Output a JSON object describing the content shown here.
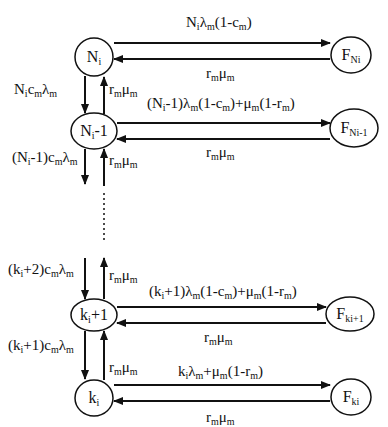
{
  "diagram": {
    "type": "markov-chain-state-transition",
    "colors": {
      "stroke": "#111111",
      "background": "#ffffff",
      "text": "#111111"
    },
    "nodes": [
      {
        "id": "Ni",
        "base": "N",
        "sub": "i",
        "suffix": "",
        "cx": 94,
        "cy": 57,
        "rx": 19,
        "ry": 19
      },
      {
        "id": "Ni-1",
        "base": "N",
        "sub": "i",
        "suffix": "-1",
        "cx": 94,
        "cy": 131,
        "rx": 23,
        "ry": 18
      },
      {
        "id": "ki+1",
        "base": "k",
        "sub": "i",
        "suffix": "+1",
        "cx": 94,
        "cy": 315,
        "rx": 23,
        "ry": 16
      },
      {
        "id": "ki",
        "base": "k",
        "sub": "i",
        "suffix": "",
        "cx": 94,
        "cy": 398,
        "rx": 19,
        "ry": 18
      },
      {
        "id": "FNi",
        "base": "F",
        "sub": "Ni",
        "suffix": "",
        "cx": 351,
        "cy": 55,
        "rx": 20,
        "ry": 18
      },
      {
        "id": "FNi-1",
        "base": "F",
        "sub": "Ni-1",
        "suffix": "",
        "cx": 354,
        "cy": 128,
        "rx": 24,
        "ry": 19
      },
      {
        "id": "Fki+1",
        "base": "F",
        "sub": "ki+1",
        "suffix": "",
        "cx": 350,
        "cy": 314,
        "rx": 24,
        "ry": 17
      },
      {
        "id": "Fki",
        "base": "F",
        "sub": "ki",
        "suffix": "",
        "cx": 351,
        "cy": 397,
        "rx": 20,
        "ry": 18
      }
    ],
    "labels": {
      "Ni_to_FNi": {
        "parts": [
          [
            "N",
            ""
          ],
          [
            "i",
            "sub"
          ],
          [
            "λ",
            ""
          ],
          [
            "m",
            "sub"
          ],
          [
            "(1-c",
            ""
          ],
          [
            "m",
            "sub"
          ],
          [
            ")",
            ""
          ]
        ]
      },
      "FNi_to_Ni": {
        "parts": [
          [
            "r",
            ""
          ],
          [
            "m",
            "sub"
          ],
          [
            "μ",
            ""
          ],
          [
            "m",
            "sub"
          ]
        ]
      },
      "Ni_to_Ni-1": {
        "parts": [
          [
            "N",
            ""
          ],
          [
            "i",
            "sub"
          ],
          [
            "c",
            ""
          ],
          [
            "m",
            "sub"
          ],
          [
            "λ",
            ""
          ],
          [
            "m",
            "sub"
          ]
        ]
      },
      "Ni-1_to_Ni": {
        "parts": [
          [
            "r",
            ""
          ],
          [
            "m",
            "sub"
          ],
          [
            "μ",
            ""
          ],
          [
            "m",
            "sub"
          ]
        ]
      },
      "Ni-1_to_FNi-1": {
        "parts": [
          [
            "(N",
            ""
          ],
          [
            "i",
            "sub"
          ],
          [
            "-1)λ",
            ""
          ],
          [
            "m",
            "sub"
          ],
          [
            "(1-c",
            ""
          ],
          [
            "m",
            "sub"
          ],
          [
            ")+μ",
            ""
          ],
          [
            "m",
            "sub"
          ],
          [
            "(1-r",
            ""
          ],
          [
            "m",
            "sub"
          ],
          [
            ")",
            ""
          ]
        ]
      },
      "FNi-1_to_Ni-1": {
        "parts": [
          [
            "r",
            ""
          ],
          [
            "m",
            "sub"
          ],
          [
            "μ",
            ""
          ],
          [
            "m",
            "sub"
          ]
        ]
      },
      "Ni-1_down": {
        "parts": [
          [
            "(N",
            ""
          ],
          [
            "i",
            "sub"
          ],
          [
            "-1)c",
            ""
          ],
          [
            "m",
            "sub"
          ],
          [
            "λ",
            ""
          ],
          [
            "m",
            "sub"
          ]
        ]
      },
      "Ni-1_up": {
        "parts": [
          [
            "r",
            ""
          ],
          [
            "m",
            "sub"
          ],
          [
            "μ",
            ""
          ],
          [
            "m",
            "sub"
          ]
        ]
      },
      "ki+1_in_down": {
        "parts": [
          [
            "(k",
            ""
          ],
          [
            "i",
            "sub"
          ],
          [
            "+2)c",
            ""
          ],
          [
            "m",
            "sub"
          ],
          [
            "λ",
            ""
          ],
          [
            "m",
            "sub"
          ]
        ]
      },
      "ki+1_out_up": {
        "parts": [
          [
            "r",
            ""
          ],
          [
            "m",
            "sub"
          ],
          [
            "μ",
            ""
          ],
          [
            "m",
            "sub"
          ]
        ]
      },
      "ki+1_to_Fki+1": {
        "parts": [
          [
            "(k",
            ""
          ],
          [
            "i",
            "sub"
          ],
          [
            "+1)λ",
            ""
          ],
          [
            "m",
            "sub"
          ],
          [
            "(1-c",
            ""
          ],
          [
            "m",
            "sub"
          ],
          [
            ")+μ",
            ""
          ],
          [
            "m",
            "sub"
          ],
          [
            "(1-r",
            ""
          ],
          [
            "m",
            "sub"
          ],
          [
            ")",
            ""
          ]
        ]
      },
      "Fki+1_to_ki+1": {
        "parts": [
          [
            "r",
            ""
          ],
          [
            "m",
            "sub"
          ],
          [
            "μ",
            ""
          ],
          [
            "m",
            "sub"
          ]
        ]
      },
      "ki+1_to_ki": {
        "parts": [
          [
            "(k",
            ""
          ],
          [
            "i",
            "sub"
          ],
          [
            "+1)c",
            ""
          ],
          [
            "m",
            "sub"
          ],
          [
            "λ",
            ""
          ],
          [
            "m",
            "sub"
          ]
        ]
      },
      "ki_to_ki+1": {
        "parts": [
          [
            "r",
            ""
          ],
          [
            "m",
            "sub"
          ],
          [
            "μ",
            ""
          ],
          [
            "m",
            "sub"
          ]
        ]
      },
      "ki_to_Fki": {
        "parts": [
          [
            "k",
            ""
          ],
          [
            "i",
            "sub"
          ],
          [
            "λ",
            ""
          ],
          [
            "m",
            "sub"
          ],
          [
            "+μ",
            ""
          ],
          [
            "m",
            "sub"
          ],
          [
            "(1-r",
            ""
          ],
          [
            "m",
            "sub"
          ],
          [
            ")",
            ""
          ]
        ]
      },
      "Fki_to_ki": {
        "parts": [
          [
            "r",
            ""
          ],
          [
            "m",
            "sub"
          ],
          [
            "μ",
            ""
          ],
          [
            "m",
            "sub"
          ]
        ]
      }
    },
    "label_positions": {
      "Ni_to_FNi": {
        "x": 186,
        "y": 15
      },
      "FNi_to_Ni": {
        "x": 206,
        "y": 66
      },
      "Ni_to_Ni-1": {
        "x": 14,
        "y": 82
      },
      "Ni-1_to_Ni": {
        "x": 109,
        "y": 82
      },
      "Ni-1_to_FNi-1": {
        "x": 147,
        "y": 96
      },
      "FNi-1_to_Ni-1": {
        "x": 206,
        "y": 145
      },
      "Ni-1_down": {
        "x": 12,
        "y": 150
      },
      "Ni-1_up": {
        "x": 109,
        "y": 153
      },
      "ki+1_in_down": {
        "x": 8,
        "y": 262
      },
      "ki+1_out_up": {
        "x": 109,
        "y": 268
      },
      "ki+1_to_Fki+1": {
        "x": 149,
        "y": 284
      },
      "Fki+1_to_ki+1": {
        "x": 204,
        "y": 330
      },
      "ki+1_to_ki": {
        "x": 8,
        "y": 338
      },
      "ki_to_ki+1": {
        "x": 109,
        "y": 360
      },
      "ki_to_Fki": {
        "x": 178,
        "y": 364
      },
      "Fki_to_ki": {
        "x": 206,
        "y": 410
      }
    },
    "horizontal_arrows": [
      {
        "from_x": 114,
        "to_x": 330,
        "y": 43,
        "dir": "right"
      },
      {
        "from_x": 330,
        "to_x": 114,
        "y": 59,
        "dir": "left"
      },
      {
        "from_x": 117,
        "to_x": 330,
        "y": 123,
        "dir": "right"
      },
      {
        "from_x": 330,
        "to_x": 117,
        "y": 139,
        "dir": "left"
      },
      {
        "from_x": 117,
        "to_x": 326,
        "y": 307,
        "dir": "right"
      },
      {
        "from_x": 326,
        "to_x": 117,
        "y": 323,
        "dir": "left"
      },
      {
        "from_x": 114,
        "to_x": 330,
        "y": 385,
        "dir": "right"
      },
      {
        "from_x": 330,
        "to_x": 114,
        "y": 401,
        "dir": "left"
      }
    ],
    "vertical_arrows": [
      {
        "x": 85,
        "from_y": 76,
        "to_y": 113,
        "dir": "down"
      },
      {
        "x": 104,
        "from_y": 114,
        "to_y": 77,
        "dir": "up"
      },
      {
        "x": 85,
        "from_y": 149,
        "to_y": 184,
        "dir": "down"
      },
      {
        "x": 104,
        "from_y": 186,
        "to_y": 149,
        "dir": "up"
      },
      {
        "x": 85,
        "from_y": 258,
        "to_y": 299,
        "dir": "down"
      },
      {
        "x": 104,
        "from_y": 299,
        "to_y": 258,
        "dir": "up"
      },
      {
        "x": 85,
        "from_y": 331,
        "to_y": 379,
        "dir": "down"
      },
      {
        "x": 104,
        "from_y": 380,
        "to_y": 331,
        "dir": "up"
      }
    ],
    "ellipsis_line": {
      "x": 104,
      "from_y": 193,
      "to_y": 240
    }
  }
}
